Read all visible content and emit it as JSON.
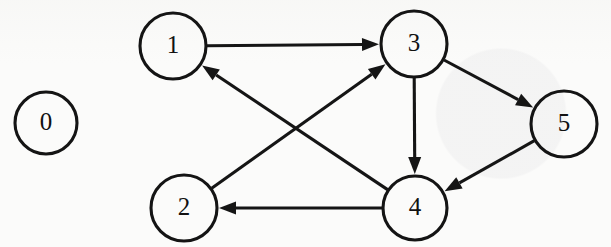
{
  "figure": {
    "type": "directed-graph",
    "background_color": "#fbfbfa",
    "ink_color": "#151515",
    "width": 611,
    "height": 247
  },
  "nodes": [
    {
      "id": "0",
      "label": "0",
      "cx": 46,
      "cy": 123,
      "r": 31,
      "isolated": true
    },
    {
      "id": "1",
      "label": "1",
      "cx": 173,
      "cy": 46,
      "r": 33,
      "isolated": false
    },
    {
      "id": "2",
      "label": "2",
      "cx": 184,
      "cy": 208,
      "r": 33,
      "isolated": false
    },
    {
      "id": "3",
      "label": "3",
      "cx": 414,
      "cy": 44,
      "r": 33,
      "isolated": false
    },
    {
      "id": "4",
      "label": "4",
      "cx": 415,
      "cy": 208,
      "r": 32,
      "isolated": false
    },
    {
      "id": "5",
      "label": "5",
      "cx": 564,
      "cy": 124,
      "r": 33,
      "isolated": false
    }
  ],
  "edges": [
    {
      "id": "e-1-3",
      "from": "1",
      "to": "3",
      "directed": true,
      "label": ""
    },
    {
      "id": "e-3-5",
      "from": "3",
      "to": "5",
      "directed": true,
      "label": ""
    },
    {
      "id": "e-3-4",
      "from": "3",
      "to": "4",
      "directed": true,
      "label": ""
    },
    {
      "id": "e-5-4",
      "from": "5",
      "to": "4",
      "directed": true,
      "label": ""
    },
    {
      "id": "e-4-2",
      "from": "4",
      "to": "2",
      "directed": true,
      "label": ""
    },
    {
      "id": "e-4-1",
      "from": "4",
      "to": "1",
      "directed": true,
      "label": ""
    },
    {
      "id": "e-2-3",
      "from": "2",
      "to": "3",
      "directed": true,
      "label": ""
    }
  ],
  "background_bleed": {
    "line_a": "",
    "line_b": "",
    "line_c": ""
  }
}
